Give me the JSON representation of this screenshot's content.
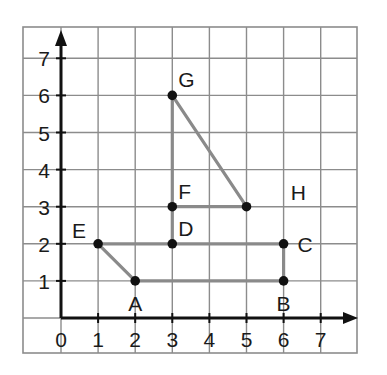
{
  "diagram": {
    "type": "coordinate-grid",
    "x_axis": {
      "ticks": [
        "0",
        "1",
        "2",
        "3",
        "4",
        "5",
        "6",
        "7"
      ]
    },
    "y_axis": {
      "ticks": [
        "1",
        "2",
        "3",
        "4",
        "5",
        "6",
        "7"
      ]
    },
    "points": [
      {
        "name": "A",
        "x": 2,
        "y": 1,
        "label_pos": "below"
      },
      {
        "name": "B",
        "x": 6,
        "y": 1,
        "label_pos": "below"
      },
      {
        "name": "C",
        "x": 6,
        "y": 2,
        "label_pos": "right"
      },
      {
        "name": "D",
        "x": 3,
        "y": 2,
        "label_pos": "above-right"
      },
      {
        "name": "E",
        "x": 1,
        "y": 2,
        "label_pos": "above-left"
      },
      {
        "name": "F",
        "x": 3,
        "y": 3,
        "label_pos": "above-right"
      },
      {
        "name": "G",
        "x": 3,
        "y": 6,
        "label_pos": "above-right"
      }
    ],
    "unmarked_points": [
      {
        "x": 5,
        "y": 3
      }
    ],
    "label_only": [
      {
        "name": "H",
        "x": 6.4,
        "y": 3.4
      }
    ],
    "segments": [
      {
        "from": [
          2,
          1
        ],
        "to": [
          6,
          1
        ]
      },
      {
        "from": [
          6,
          1
        ],
        "to": [
          6,
          2
        ]
      },
      {
        "from": [
          6,
          2
        ],
        "to": [
          1,
          2
        ]
      },
      {
        "from": [
          1,
          2
        ],
        "to": [
          2,
          1
        ]
      },
      {
        "from": [
          3,
          2
        ],
        "to": [
          3,
          6
        ]
      },
      {
        "from": [
          3,
          6
        ],
        "to": [
          5,
          3
        ]
      },
      {
        "from": [
          5,
          3
        ],
        "to": [
          3,
          3
        ]
      }
    ],
    "colors": {
      "grid": "#8c8c8c",
      "axis": "#111111",
      "segment": "#8a8a8a",
      "point": "#111111",
      "text": "#1a1a1a"
    }
  }
}
